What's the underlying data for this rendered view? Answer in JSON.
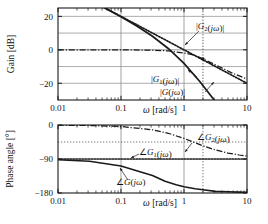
{
  "figure": {
    "title": "",
    "type": "bode-plot"
  },
  "chart_data": [
    {
      "type": "line",
      "panel": "gain",
      "title": "",
      "xlabel": "ω [rad/s]",
      "ylabel": "Gain [dB]",
      "xscale": "log",
      "xlim": [
        0.01,
        10
      ],
      "ylim": [
        -30,
        25
      ],
      "xticks": [
        0.01,
        0.1,
        1,
        10
      ],
      "xticklabels": [
        "0.01",
        "0.1",
        "1",
        "10"
      ],
      "yticks": [
        -20,
        0,
        20
      ],
      "yticklabels": [
        "-20",
        "0",
        "20"
      ],
      "grid": true,
      "series": [
        {
          "name": "|G(jω)|",
          "style": "solid",
          "expression": "20*log10(1/(w*sqrt(1+(w/0.3)^2)))",
          "x": [
            0.01,
            0.0178,
            0.0316,
            0.0562,
            0.1,
            0.178,
            0.316,
            0.562,
            1.0,
            1.78,
            3.16,
            5.62,
            10.0
          ],
          "y": [
            40.0,
            35.0,
            30.0,
            24.9,
            19.7,
            14.2,
            8.1,
            0.8,
            -8.1,
            -18.9,
            -31.0,
            -43.8,
            -57.0
          ]
        },
        {
          "name": "|G1(jω)|",
          "style": "dotted",
          "expression": "20*log10(1/w)",
          "x": [
            0.01,
            0.0178,
            0.0316,
            0.0562,
            0.1,
            0.178,
            0.316,
            0.562,
            1.0,
            1.78,
            3.16,
            5.62,
            10.0
          ],
          "y": [
            40.0,
            35.0,
            30.0,
            25.0,
            20.0,
            15.0,
            10.0,
            5.0,
            0.0,
            -5.0,
            -10.0,
            -15.0,
            -20.0
          ]
        },
        {
          "name": "|G2(jω)|",
          "style": "dashdot",
          "expression": "20*log10(1/sqrt(1+(w/1.4)^2))",
          "x": [
            0.01,
            0.0316,
            0.1,
            0.316,
            0.562,
            1.0,
            1.4,
            2.0,
            3.16,
            5.62,
            10.0
          ],
          "y": [
            0.0,
            0.0,
            -0.02,
            -0.2,
            -0.65,
            -1.9,
            -3.0,
            -5.4,
            -9.0,
            -13.6,
            -17.5
          ]
        }
      ],
      "annotations": [
        {
          "text": "|G2(jω)|",
          "x_px": 196,
          "y_px": 26
        },
        {
          "text": "|G1(jω)|",
          "x_px": 151,
          "y_px": 80
        },
        {
          "text": "|G(jω)|",
          "x_px": 160,
          "y_px": 93
        }
      ],
      "vertical_marker": {
        "x": 2.0,
        "style": "dotted"
      }
    },
    {
      "type": "line",
      "panel": "phase",
      "title": "",
      "xlabel": "ω [rad/s]",
      "ylabel": "Phase angle [°]",
      "xscale": "log",
      "xlim": [
        0.01,
        10
      ],
      "ylim": [
        -180,
        0
      ],
      "xticks": [
        0.01,
        0.1,
        1,
        10
      ],
      "xticklabels": [
        "0.01",
        "0.1",
        "1",
        "10"
      ],
      "yticks": [
        0,
        -90,
        -180
      ],
      "yticklabels": [
        "0",
        "-90",
        "-180"
      ],
      "grid": true,
      "series": [
        {
          "name": "∠G(jω)",
          "style": "solid",
          "expression": "-90 - atan(w/0.3)",
          "x": [
            0.01,
            0.0316,
            0.1,
            0.2,
            0.316,
            0.5,
            0.75,
            1.0,
            1.5,
            2.0,
            3.16,
            5.0,
            7.5,
            10.0
          ],
          "y": [
            -91.9,
            -96.0,
            -108.4,
            -123.7,
            -133.5,
            -149.0,
            -158.2,
            -163.3,
            -168.7,
            -171.5,
            -175.6,
            -176.6,
            -177.7,
            -178.3
          ]
        },
        {
          "name": "∠G1(jω)",
          "style": "dotted",
          "expression": "-90",
          "x": [
            0.01,
            10.0
          ],
          "y": [
            -90.0,
            -90.0
          ]
        },
        {
          "name": "∠G2(jω)",
          "style": "dashdot",
          "expression": "-atan(w/1.4)",
          "x": [
            0.01,
            0.0316,
            0.1,
            0.316,
            0.562,
            1.0,
            1.4,
            2.0,
            3.16,
            5.0,
            7.5,
            10.0
          ],
          "y": [
            -0.4,
            -1.3,
            -4.1,
            -12.7,
            -21.9,
            -35.5,
            -45.0,
            -55.0,
            -66.1,
            -74.4,
            -79.4,
            -82.0
          ]
        }
      ],
      "annotations": [
        {
          "text": "∠G2(jω)",
          "x_px": 197,
          "y_px": 137
        },
        {
          "text": "∠G1(jω)",
          "x_px": 141,
          "y_px": 152
        },
        {
          "text": "∠G(jω)",
          "x_px": 119,
          "y_px": 182
        }
      ],
      "horizontal_marker": {
        "y": -45,
        "style": "dotted"
      },
      "vertical_marker": {
        "x": 2.0,
        "style": "dotted"
      }
    }
  ],
  "labels": {
    "gain_axis": "Gain [dB]",
    "phase_axis": "Phase angle [°]",
    "omega_axis": "ω [rad/s]",
    "omega_symbol": "ω",
    "unit_rads": "[rad/s]",
    "gain_ticks": [
      "20",
      "0",
      "-20"
    ],
    "phase_ticks": [
      "0",
      "-90",
      "-180"
    ],
    "x_ticks": [
      "0.01",
      "0.1",
      "1",
      "10"
    ],
    "g2_mag": "|G₂(jω)|",
    "g1_mag": "|G₁(jω)|",
    "g_mag": "|G(jω)|",
    "g2_phase": "∠G₂(jω)",
    "g1_phase": "∠G₁(jω)",
    "g_phase": "∠G(jω)"
  },
  "colors": {
    "ink": "#1a1a1a",
    "grid": "#8a8a8a",
    "background": "#ffffff"
  }
}
